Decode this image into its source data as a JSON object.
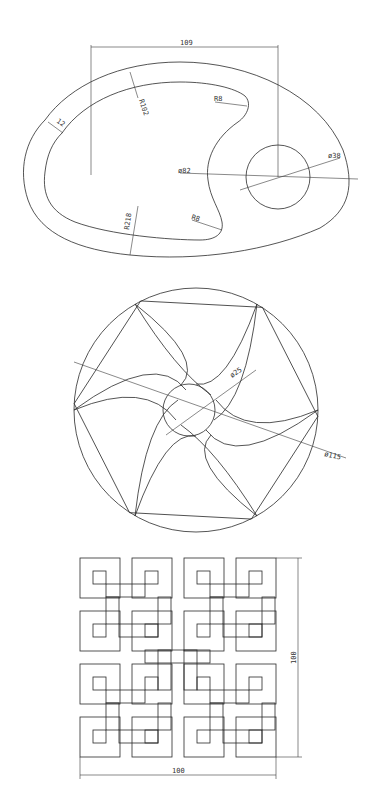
{
  "drawing1": {
    "dim_top": "109",
    "r_outer": "R102",
    "width_12": "12",
    "r8_top": "R8",
    "phi82": "ø82",
    "phi38": "ø38",
    "r218": "R218",
    "r8_bottom": "R8"
  },
  "drawing2": {
    "phi25": "ø25",
    "phi115": "ø115"
  },
  "drawing3": {
    "dim_horizontal": "100",
    "dim_vertical": "100"
  }
}
